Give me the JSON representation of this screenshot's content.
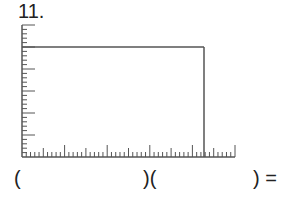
{
  "problem": {
    "number": "11.",
    "expression": {
      "open1": "(",
      "close_open": ")(",
      "close_eq": ") ="
    }
  },
  "figure": {
    "type": "area-model-rectangle",
    "x_axis": {
      "origin_px": 22,
      "end_px": 235,
      "y_px": 157,
      "minor_ticks": 50,
      "minor_spacing_px": 4.26,
      "medium_every": 5,
      "long_every": 10
    },
    "y_axis": {
      "x_px": 22,
      "top_px": 25,
      "bottom_px": 157,
      "minor_ticks": 30,
      "minor_spacing_px": 4.4,
      "medium_every": 5
    },
    "rectangle": {
      "width_units": 42,
      "height_units": 25,
      "right_px": 204,
      "top_px": 47
    },
    "stroke_color": "#555555"
  }
}
